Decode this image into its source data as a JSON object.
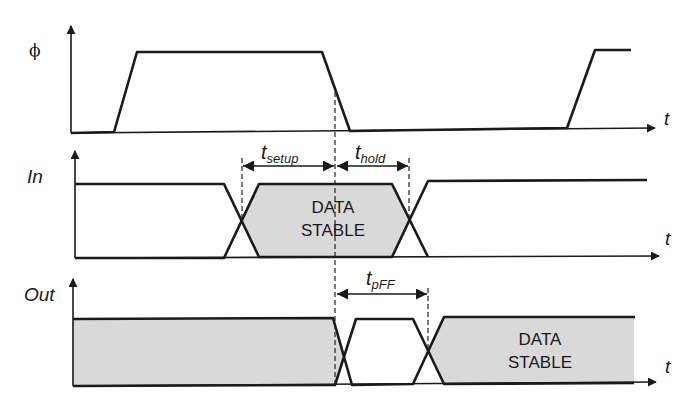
{
  "diagram": {
    "type": "timing-diagram",
    "signals": [
      {
        "name": "phi",
        "label": "ϕ",
        "description": "clock"
      },
      {
        "name": "in",
        "label": "In",
        "description": "flip-flop input"
      },
      {
        "name": "out",
        "label": "Out",
        "description": "flip-flop output"
      }
    ],
    "time_axis_label": "t",
    "stable_region_label_line1": "DATA",
    "stable_region_label_line2": "STABLE",
    "timing_parameters": {
      "setup": {
        "base": "t",
        "sub": "setup"
      },
      "hold": {
        "base": "t",
        "sub": "hold"
      },
      "prop": {
        "base": "t",
        "sub": "pFF"
      }
    },
    "colors": {
      "line": "#1a1a1a",
      "stable_fill": "#d9d9d9",
      "background": "#ffffff"
    }
  }
}
